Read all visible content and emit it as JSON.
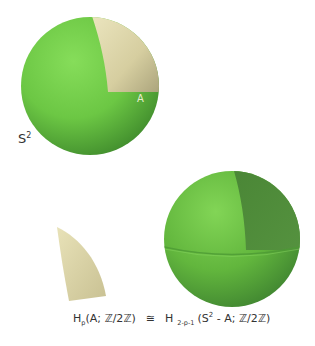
{
  "labels": {
    "region": "A",
    "sphere_base": "S",
    "sphere_exp": "2"
  },
  "formula": {
    "lhs_H": "H",
    "lhs_sub": "p",
    "lhs_args": "(A; ℤ/2ℤ)",
    "relation": "≅",
    "rhs_H": "H",
    "rhs_sub": "2-p-1",
    "rhs_open": "(S",
    "rhs_exp": "2",
    "rhs_args": " - A; ℤ/2ℤ)"
  },
  "colors": {
    "sphere_green": "#6cc744",
    "sphere_shadow": "#3f8a2c",
    "patch_cream": "#d8d0a0",
    "cavity_dark": "#4f8a3a"
  }
}
